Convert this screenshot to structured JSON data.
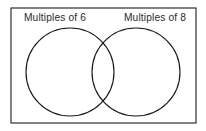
{
  "diagram": {
    "type": "venn-diagram",
    "sets": [
      {
        "id": "left-set",
        "label": "Multiples of 6",
        "label_anchor_x": 55,
        "label_baseline_y": 21,
        "circle": {
          "cx": 70,
          "cy": 72,
          "r": 44
        }
      },
      {
        "id": "right-set",
        "label": "Multiples of 8",
        "label_anchor_x": 155,
        "label_baseline_y": 21,
        "circle": {
          "cx": 136,
          "cy": 72,
          "r": 44
        }
      }
    ],
    "universe": {
      "x": 11,
      "y": 8,
      "width": 185,
      "height": 115
    },
    "intersection_points": [
      {
        "x": 103,
        "y": 39
      },
      {
        "x": 103,
        "y": 106
      }
    ],
    "colors": {
      "background": "#ffffff",
      "stroke": "#1a1a1a",
      "text": "#2a2a2a"
    }
  }
}
